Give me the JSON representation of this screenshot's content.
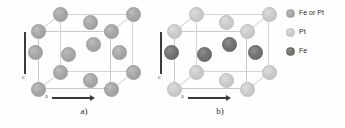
{
  "figure": {
    "background": "#ffffff"
  },
  "colors": {
    "atom_fe_or_pt": "#a8a8a8",
    "atom_pt": "#cbcbcb",
    "atom_fe": "#737373",
    "cell_edge": "#c9c9c9",
    "axis": "#3a3a3a",
    "text": "#2b2b2b"
  },
  "panels": [
    {
      "id": "a",
      "caption": "a)",
      "axis_vertical_label": "c",
      "axis_horizontal_label": "a",
      "atom_species": "fe-or-pt",
      "atoms": [
        {
          "name": "corner-back-top-left",
          "x": 46,
          "y": 14,
          "r": 7.5,
          "type": "both"
        },
        {
          "name": "corner-back-top-right",
          "x": 119,
          "y": 14,
          "r": 7.5,
          "type": "both"
        },
        {
          "name": "face-top-center",
          "x": 76,
          "y": 22,
          "r": 7.5,
          "type": "both"
        },
        {
          "name": "corner-front-top-left",
          "x": 24,
          "y": 31,
          "r": 7.5,
          "type": "both"
        },
        {
          "name": "corner-front-top-right",
          "x": 97,
          "y": 31,
          "r": 7.5,
          "type": "both"
        },
        {
          "name": "face-right-center",
          "x": 79,
          "y": 44,
          "r": 7.5,
          "type": "both"
        },
        {
          "name": "face-left-center",
          "x": 21,
          "y": 52,
          "r": 7.5,
          "type": "both"
        },
        {
          "name": "body-center",
          "x": 54,
          "y": 54,
          "r": 7.5,
          "type": "both"
        },
        {
          "name": "face-back-center",
          "x": 105,
          "y": 52,
          "r": 7.5,
          "type": "both"
        },
        {
          "name": "corner-back-bottom-left",
          "x": 46,
          "y": 72,
          "r": 7.5,
          "type": "both"
        },
        {
          "name": "corner-back-bottom-right",
          "x": 119,
          "y": 72,
          "r": 7.5,
          "type": "both"
        },
        {
          "name": "face-bottom-center",
          "x": 76,
          "y": 80,
          "r": 7.5,
          "type": "both"
        },
        {
          "name": "corner-front-bottom-left",
          "x": 24,
          "y": 89,
          "r": 7.5,
          "type": "both"
        },
        {
          "name": "corner-front-bottom-right",
          "x": 97,
          "y": 89,
          "r": 7.5,
          "type": "both"
        }
      ]
    },
    {
      "id": "b",
      "caption": "b)",
      "axis_vertical_label": "c",
      "axis_horizontal_label": "a",
      "atom_species": "ordered-fe-pt",
      "atoms": [
        {
          "name": "corner-back-top-left",
          "x": 46,
          "y": 14,
          "r": 7.5,
          "type": "pt"
        },
        {
          "name": "corner-back-top-right",
          "x": 119,
          "y": 14,
          "r": 7.5,
          "type": "pt"
        },
        {
          "name": "face-top-center",
          "x": 76,
          "y": 22,
          "r": 7.5,
          "type": "pt"
        },
        {
          "name": "corner-front-top-left",
          "x": 24,
          "y": 31,
          "r": 7.5,
          "type": "pt"
        },
        {
          "name": "corner-front-top-right",
          "x": 97,
          "y": 31,
          "r": 7.5,
          "type": "pt"
        },
        {
          "name": "face-right-center",
          "x": 79,
          "y": 44,
          "r": 7.5,
          "type": "fe"
        },
        {
          "name": "face-left-center",
          "x": 21,
          "y": 52,
          "r": 7.5,
          "type": "fe"
        },
        {
          "name": "body-center",
          "x": 54,
          "y": 54,
          "r": 7.5,
          "type": "fe"
        },
        {
          "name": "face-back-center",
          "x": 105,
          "y": 52,
          "r": 7.5,
          "type": "fe"
        },
        {
          "name": "corner-back-bottom-left",
          "x": 46,
          "y": 72,
          "r": 7.5,
          "type": "pt"
        },
        {
          "name": "corner-back-bottom-right",
          "x": 119,
          "y": 72,
          "r": 7.5,
          "type": "pt"
        },
        {
          "name": "face-bottom-center",
          "x": 76,
          "y": 80,
          "r": 7.5,
          "type": "pt"
        },
        {
          "name": "corner-front-bottom-left",
          "x": 24,
          "y": 89,
          "r": 7.5,
          "type": "pt"
        },
        {
          "name": "corner-front-bottom-right",
          "x": 97,
          "y": 89,
          "r": 7.5,
          "type": "pt"
        }
      ]
    }
  ],
  "legend": {
    "items": [
      {
        "label": "Fe or Pt",
        "type": "both",
        "swatch_color": "#a8a8a8"
      },
      {
        "label": "Pt",
        "type": "pt",
        "swatch_color": "#cbcbcb"
      },
      {
        "label": "Fe",
        "type": "fe",
        "swatch_color": "#737373"
      }
    ]
  }
}
